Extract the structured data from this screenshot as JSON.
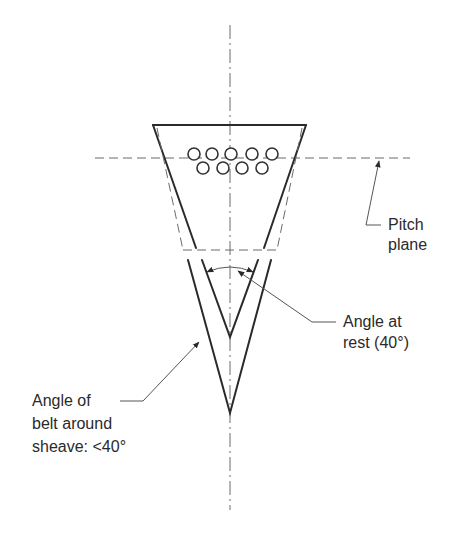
{
  "figure": {
    "labels": {
      "pitch_plane": [
        "Pitch",
        "plane"
      ],
      "angle_at_rest": [
        "Angle at",
        "rest (40°)"
      ],
      "angle_around_sheave": [
        "Angle of",
        "belt around",
        "sheave: <40°"
      ]
    },
    "annotations": {
      "rest_angle_deg": "40",
      "sheave_angle": "<40°"
    },
    "colors": {
      "line": "#2a2a2a",
      "dashed": "#6a6a6a",
      "background": "#ffffff"
    }
  }
}
